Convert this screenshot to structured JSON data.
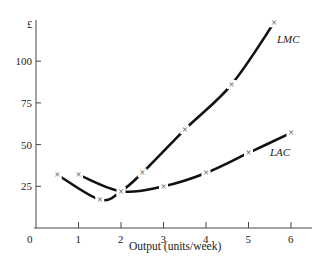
{
  "chart_data": {
    "type": "line",
    "title": "",
    "xlabel": "Output (units/week)",
    "ylabel": "£",
    "xlim": [
      0,
      6.5
    ],
    "ylim": [
      0,
      125
    ],
    "x_ticks": [
      "0",
      "1",
      "2",
      "3",
      "4",
      "5",
      "6"
    ],
    "y_ticks": [
      "25",
      "50",
      "75",
      "100"
    ],
    "grid": false,
    "legend": "none (curves labelled directly)",
    "series": [
      {
        "name": "LMC",
        "label_position": "end near top-right",
        "points": [
          {
            "x": 0.5,
            "y": 32
          },
          {
            "x": 1.5,
            "y": 17
          },
          {
            "x": 2.0,
            "y": 22
          },
          {
            "x": 2.5,
            "y": 33
          },
          {
            "x": 3.5,
            "y": 59
          },
          {
            "x": 4.6,
            "y": 86
          },
          {
            "x": 5.6,
            "y": 123
          }
        ]
      },
      {
        "name": "LAC",
        "label_position": "below right end",
        "points": [
          {
            "x": 1.0,
            "y": 32
          },
          {
            "x": 2.0,
            "y": 22
          },
          {
            "x": 3.0,
            "y": 25
          },
          {
            "x": 4.0,
            "y": 33
          },
          {
            "x": 5.0,
            "y": 45
          },
          {
            "x": 6.0,
            "y": 57
          }
        ]
      }
    ]
  },
  "labels": {
    "y_unit": "£",
    "origin": "0",
    "x_axis_title": "Output (units/week)",
    "lmc": "LMC",
    "lac": "LAC",
    "marker_glyph": "×"
  }
}
